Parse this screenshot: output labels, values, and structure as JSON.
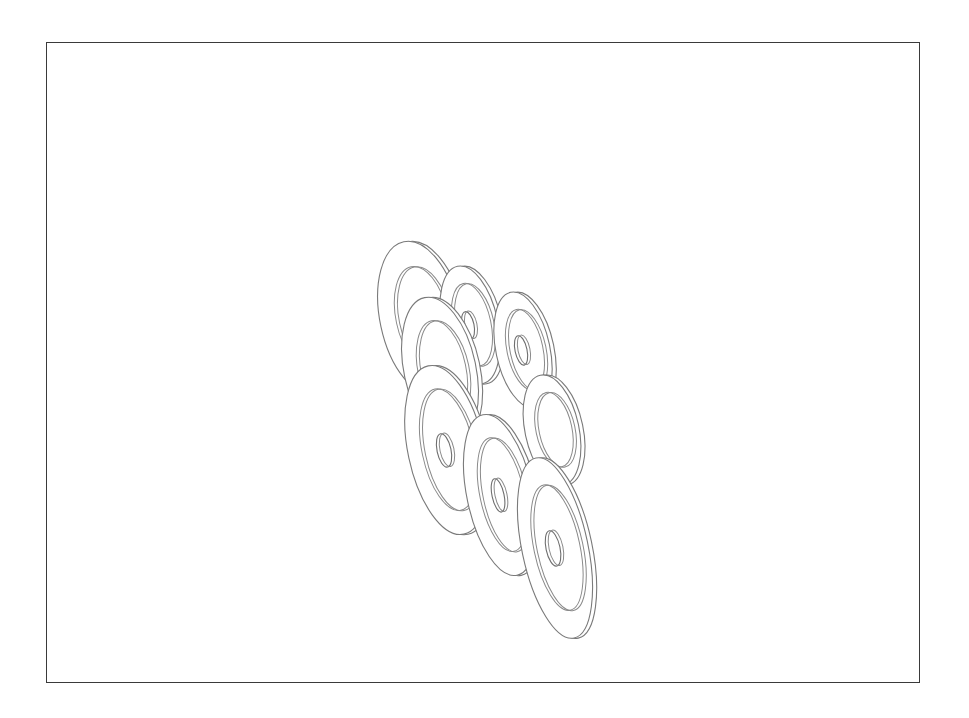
{
  "drawing": {
    "subject": "washers",
    "count": 8,
    "stroke_color": "#7a7a7a",
    "frame_color": "#3a3a3a",
    "background": "#ffffff",
    "washers": [
      {
        "cx": 420,
        "cy": 318,
        "rx": 40,
        "ry": 78,
        "irx": 26,
        "iry": 52,
        "hrx": 0,
        "hry": 0
      },
      {
        "cx": 470,
        "cy": 325,
        "rx": 28,
        "ry": 60,
        "irx": 19,
        "iry": 42,
        "hrx": 6,
        "hry": 14
      },
      {
        "cx": 523,
        "cy": 350,
        "rx": 27,
        "ry": 59,
        "irx": 18,
        "iry": 41,
        "hrx": 6,
        "hry": 15
      },
      {
        "cx": 440,
        "cy": 370,
        "rx": 36,
        "ry": 74,
        "irx": 24,
        "iry": 50,
        "hrx": 0,
        "hry": 0
      },
      {
        "cx": 552,
        "cy": 430,
        "rx": 27,
        "ry": 56,
        "irx": 18,
        "iry": 38,
        "hrx": 0,
        "hry": 0
      },
      {
        "cx": 446,
        "cy": 450,
        "rx": 38,
        "ry": 86,
        "irx": 26,
        "iry": 62,
        "hrx": 7,
        "hry": 17
      },
      {
        "cx": 500,
        "cy": 495,
        "rx": 33,
        "ry": 82,
        "irx": 22,
        "iry": 58,
        "hrx": 6,
        "hry": 17
      },
      {
        "cx": 555,
        "cy": 548,
        "rx": 33,
        "ry": 92,
        "irx": 23,
        "iry": 64,
        "hrx": 7,
        "hry": 18
      }
    ]
  }
}
